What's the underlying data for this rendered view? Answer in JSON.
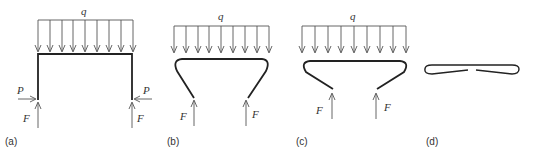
{
  "figure": {
    "panels": [
      {
        "id": "a",
        "label": "(a)",
        "load_label": "q",
        "left_horizontal_force": "P",
        "right_horizontal_force": "P",
        "left_vertical_force": "F",
        "right_vertical_force": "F",
        "shape": "rectangular frame"
      },
      {
        "id": "b",
        "label": "(b)",
        "load_label": "q",
        "left_vertical_force": "F",
        "right_vertical_force": "F",
        "shape": "deformed frame with legs angled inward"
      },
      {
        "id": "c",
        "label": "(c)",
        "load_label": "q",
        "left_vertical_force": "F",
        "right_vertical_force": "F",
        "shape": "flattened frame with legs more inclined"
      },
      {
        "id": "d",
        "label": "(d)",
        "shape": "fully flattened loop with central gap"
      }
    ],
    "colors": {
      "frame": "#222222",
      "arrows": "#555555",
      "text": "#333333"
    }
  }
}
